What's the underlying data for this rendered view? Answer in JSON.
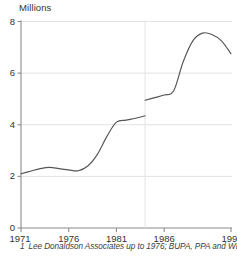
{
  "figure": {
    "y_unit_label": "Millions",
    "footnote_marker": "1",
    "footnote_text": "Lee Donaldson Associates up to 1976; BUPA, PPA and WPA"
  },
  "axis": {
    "y_ticks": [
      "0",
      "2",
      "4",
      "6",
      "8"
    ],
    "x_ticks": [
      "1971",
      "1976",
      "1981",
      "1986",
      "1993"
    ]
  },
  "colors": {
    "line": "#555555",
    "grid": "#e2e2e2",
    "axis": "#8c8c8c",
    "text": "#333333",
    "background": "#ffffff"
  },
  "chart_data": {
    "type": "line",
    "title": "",
    "subtitle": "",
    "xlabel": "",
    "ylabel": "Millions",
    "xlim": [
      1971,
      1993
    ],
    "ylim": [
      0,
      8
    ],
    "grid": true,
    "legend": "none",
    "y_tick_values": [
      0,
      2,
      4,
      6,
      8
    ],
    "x_tick_values": [
      1971,
      1976,
      1981,
      1986,
      1993
    ],
    "annotations": [
      "Series break between 1984 and 1984 (discontinuity; source change)"
    ],
    "series": [
      {
        "name": "Persons covered (Lee Donaldson Associates basis)",
        "x": [
          1971,
          1972,
          1973,
          1974,
          1975,
          1976,
          1977,
          1978,
          1979,
          1980,
          1981,
          1982,
          1983,
          1984
        ],
        "values": [
          2.1,
          2.2,
          2.3,
          2.35,
          2.3,
          2.25,
          2.22,
          2.4,
          2.85,
          3.55,
          4.1,
          4.18,
          4.25,
          4.35
        ]
      },
      {
        "name": "Persons covered (BUPA, PPA and WPA basis)",
        "x": [
          1984,
          1985,
          1986,
          1987,
          1988,
          1989,
          1990,
          1991,
          1992,
          1993
        ],
        "values": [
          4.95,
          5.05,
          5.15,
          5.32,
          6.45,
          7.25,
          7.55,
          7.5,
          7.25,
          6.75
        ]
      }
    ]
  }
}
